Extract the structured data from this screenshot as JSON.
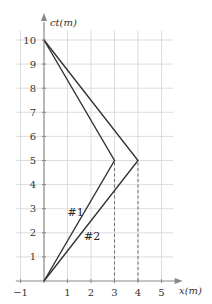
{
  "chart_data": {
    "type": "line",
    "title": "",
    "xlabel": "x(m)",
    "ylabel": "ct(m)",
    "xlim": [
      -1,
      5.5
    ],
    "ylim": [
      0,
      10.5
    ],
    "x_ticks": [
      "-1",
      "1",
      "2",
      "3",
      "4",
      "5"
    ],
    "y_ticks": [
      "1",
      "2",
      "3",
      "4",
      "5",
      "6",
      "7",
      "8",
      "9",
      "10"
    ],
    "grid": true,
    "legend": "none",
    "series": [
      {
        "name": "#1",
        "x": [
          0,
          3,
          0
        ],
        "y": [
          0,
          5,
          10
        ]
      },
      {
        "name": "#2",
        "x": [
          0,
          4,
          0
        ],
        "y": [
          0,
          5,
          10
        ]
      }
    ],
    "annotations": [
      {
        "type": "dashed-vertical",
        "x": 3,
        "from_y": 0,
        "to_y": 5
      },
      {
        "type": "dashed-vertical",
        "x": 4,
        "from_y": 0,
        "to_y": 5
      },
      {
        "type": "label",
        "text": "#1",
        "x": 1.0,
        "y": 2.7
      },
      {
        "type": "label",
        "text": "#2",
        "x": 1.7,
        "y": 1.7
      }
    ]
  },
  "colors": {
    "grid": "#d4d4d4",
    "axis": "#888888",
    "line": "#333333",
    "dashed": "#777777"
  }
}
